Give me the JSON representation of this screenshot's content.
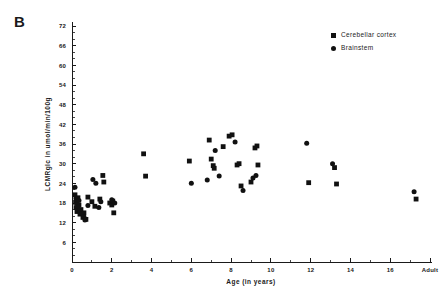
{
  "figure": {
    "panel_label": "B",
    "marker_color": "#111111",
    "axis_color": "#1a1a1a",
    "background": "#ffffff"
  },
  "legend": {
    "position": "top-right",
    "entries": [
      {
        "label": "Cerebellar cortex",
        "marker": "square",
        "icon": "square-marker-icon"
      },
      {
        "label": "Brainstem",
        "marker": "circle",
        "icon": "circle-marker-icon"
      }
    ]
  },
  "chart_data": {
    "type": "scatter",
    "title": "",
    "subtitle": "",
    "xlabel": "Age (in years)",
    "ylabel": "LCMRglc in umol/min/100g",
    "xlim": [
      0,
      18
    ],
    "ylim": [
      0,
      72
    ],
    "grid": false,
    "legend_position": "top-right",
    "annotations": [
      "B"
    ],
    "xticks": [
      0,
      2,
      4,
      6,
      8,
      10,
      12,
      14,
      16,
      18
    ],
    "xticklabels": [
      "0",
      "2",
      "4",
      "6",
      "8",
      "10",
      "12",
      "14",
      "16",
      "Adult"
    ],
    "xtick_minor_step": 1,
    "yticks": [
      6,
      12,
      18,
      24,
      30,
      36,
      42,
      48,
      54,
      60,
      66,
      72
    ],
    "yticklabels": [
      "6",
      "12",
      "18",
      "24",
      "30",
      "36",
      "42",
      "48",
      "54",
      "60",
      "66",
      "72"
    ],
    "ytick_minor_step": 2,
    "series": [
      {
        "name": "Cerebellar cortex",
        "marker": "square",
        "points": [
          [
            0.15,
            20.5
          ],
          [
            0.18,
            18.2
          ],
          [
            0.2,
            16.6
          ],
          [
            0.25,
            15.4
          ],
          [
            0.3,
            19.6
          ],
          [
            0.35,
            17.4
          ],
          [
            0.4,
            14.6
          ],
          [
            0.45,
            16.0
          ],
          [
            0.55,
            13.6
          ],
          [
            0.6,
            15.0
          ],
          [
            0.7,
            13.0
          ],
          [
            0.8,
            19.8
          ],
          [
            1.0,
            18.4
          ],
          [
            1.15,
            17.0
          ],
          [
            1.4,
            19.2
          ],
          [
            1.55,
            26.4
          ],
          [
            1.6,
            24.4
          ],
          [
            1.9,
            18.0
          ],
          [
            2.0,
            17.4
          ],
          [
            2.05,
            18.6
          ],
          [
            2.1,
            15.0
          ],
          [
            3.6,
            33.0
          ],
          [
            3.7,
            26.2
          ],
          [
            5.9,
            30.8
          ],
          [
            6.9,
            37.2
          ],
          [
            7.0,
            31.4
          ],
          [
            7.1,
            29.4
          ],
          [
            7.15,
            28.6
          ],
          [
            7.6,
            35.2
          ],
          [
            7.9,
            38.4
          ],
          [
            8.05,
            38.8
          ],
          [
            8.3,
            29.6
          ],
          [
            8.4,
            30.0
          ],
          [
            8.5,
            23.2
          ],
          [
            9.0,
            24.4
          ],
          [
            9.2,
            34.8
          ],
          [
            9.3,
            35.4
          ],
          [
            9.35,
            29.6
          ],
          [
            11.9,
            24.2
          ],
          [
            13.2,
            28.8
          ],
          [
            13.3,
            23.8
          ],
          [
            17.3,
            19.2
          ]
        ]
      },
      {
        "name": "Brainstem",
        "marker": "circle",
        "points": [
          [
            0.15,
            22.8
          ],
          [
            0.2,
            19.4
          ],
          [
            0.25,
            17.8
          ],
          [
            0.3,
            16.8
          ],
          [
            0.35,
            18.8
          ],
          [
            0.4,
            15.8
          ],
          [
            0.5,
            14.8
          ],
          [
            0.6,
            13.8
          ],
          [
            0.65,
            12.8
          ],
          [
            0.8,
            17.2
          ],
          [
            1.05,
            25.2
          ],
          [
            1.2,
            24.0
          ],
          [
            1.35,
            16.6
          ],
          [
            1.45,
            18.4
          ],
          [
            2.0,
            19.0
          ],
          [
            2.15,
            18.0
          ],
          [
            6.0,
            24.0
          ],
          [
            6.8,
            25.0
          ],
          [
            7.2,
            34.0
          ],
          [
            7.4,
            26.2
          ],
          [
            8.2,
            36.6
          ],
          [
            8.6,
            21.8
          ],
          [
            9.1,
            25.6
          ],
          [
            9.25,
            26.4
          ],
          [
            11.8,
            36.2
          ],
          [
            13.1,
            30.0
          ],
          [
            17.2,
            21.4
          ]
        ]
      }
    ]
  }
}
